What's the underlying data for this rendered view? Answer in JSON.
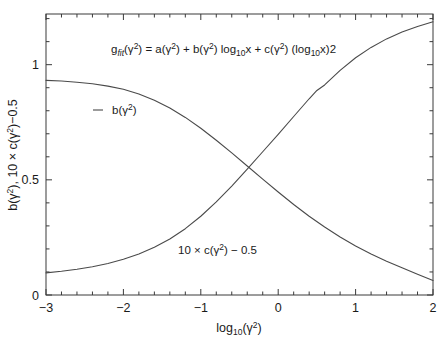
{
  "chart_data": {
    "type": "line",
    "title": "",
    "annotation": "g_fit(γ²) = a(γ²) + b(γ²)  log10x + c(γ²) (log10x)2",
    "annotation_parts": {
      "g": "g",
      "g_sub": "fit",
      "after_g": "(γ",
      "g_sup": "2",
      "eq": ") = a(γ",
      "a_sup": "2",
      "plus_b": ") + b(γ",
      "b_sup": "2",
      "log1": ")  log",
      "log1_sub": "10",
      "x1": "x + c(γ",
      "c_sup": "2",
      "log2": ") (log",
      "log2_sub": "10",
      "tail": "x)2"
    },
    "xlabel": "log10(γ²)",
    "xlabel_parts": {
      "base": "log",
      "sub": "10",
      "arg_open": "(γ",
      "sup": "2",
      "arg_close": ")"
    },
    "ylabel": "b(γ²), 10 × c(γ²)−0.5",
    "ylabel_parts": {
      "b": "b(γ",
      "b_sup": "2",
      "mid": "), 10 × c(γ",
      "c_sup": "2",
      "tail": ")−0.5"
    },
    "xlim": [
      -3,
      2
    ],
    "ylim": [
      0,
      1.22
    ],
    "xticks": [
      -3,
      -2,
      -1,
      0,
      1,
      2
    ],
    "xticklabels": [
      "−3",
      "−2",
      "−1",
      "0",
      "1",
      "2"
    ],
    "yticks": [
      0,
      0.5,
      1
    ],
    "yticklabels": [
      "0",
      "0.5",
      "1"
    ],
    "x_minor_per_major": 5,
    "y_minor_per_major": 5,
    "grid": false,
    "legend_position": "inline-annotations",
    "line_color": "#4a4a4a",
    "axis_color": "#3a3a3a",
    "background": "#ffffff",
    "series": [
      {
        "name": "b(γ²)",
        "label_parts": {
          "base": "b(γ",
          "sup": "2",
          "tail": ")"
        },
        "label_x": -2.38,
        "label_y": 0.79,
        "has_line_sample": true,
        "x": [
          -3.0,
          -2.8,
          -2.6,
          -2.4,
          -2.2,
          -2.0,
          -1.8,
          -1.6,
          -1.4,
          -1.2,
          -1.0,
          -0.8,
          -0.6,
          -0.4,
          -0.2,
          0.0,
          0.2,
          0.4,
          0.6,
          0.8,
          1.0,
          1.2,
          1.4,
          1.6,
          1.8,
          2.0
        ],
        "y": [
          0.932,
          0.929,
          0.924,
          0.917,
          0.907,
          0.893,
          0.873,
          0.846,
          0.812,
          0.771,
          0.724,
          0.672,
          0.617,
          0.56,
          0.503,
          0.447,
          0.393,
          0.342,
          0.295,
          0.252,
          0.213,
          0.178,
          0.147,
          0.118,
          0.09,
          0.063
        ]
      },
      {
        "name": "10 × c(γ²) − 0.5",
        "label_parts": {
          "base": "10 × c(γ",
          "sup": "2",
          "tail": ") − 0.5"
        },
        "label_x": -0.3,
        "label_y": 0.205,
        "has_line_sample": false,
        "x": [
          -3.0,
          -2.8,
          -2.6,
          -2.4,
          -2.2,
          -2.0,
          -1.8,
          -1.6,
          -1.4,
          -1.2,
          -1.0,
          -0.8,
          -0.6,
          -0.4,
          -0.2,
          0.0,
          0.2,
          0.4,
          0.5,
          0.6,
          0.8,
          1.0,
          1.2,
          1.4,
          1.6,
          1.8,
          2.0
        ],
        "y": [
          0.096,
          0.103,
          0.112,
          0.123,
          0.137,
          0.155,
          0.178,
          0.207,
          0.243,
          0.288,
          0.342,
          0.404,
          0.473,
          0.546,
          0.622,
          0.697,
          0.775,
          0.852,
          0.888,
          0.912,
          0.975,
          1.03,
          1.075,
          1.112,
          1.142,
          1.166,
          1.186
        ]
      }
    ]
  },
  "plot_area": {
    "left": 46,
    "right": 433,
    "top": 14,
    "bottom": 295
  }
}
